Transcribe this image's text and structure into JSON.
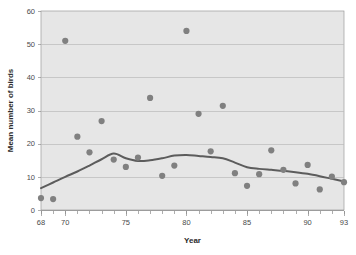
{
  "chart_data": {
    "type": "scatter",
    "title": "",
    "xlabel": "Year",
    "ylabel": "Mean number of birds",
    "xlim": [
      68,
      93
    ],
    "ylim": [
      0,
      60
    ],
    "grid": true,
    "legend": "none",
    "xticks": [
      68,
      70,
      75,
      80,
      85,
      90,
      93
    ],
    "xtick_labels": [
      "68",
      "70",
      "75",
      "80",
      "85",
      "90",
      "93"
    ],
    "xminor_step": 1,
    "yticks": [
      0,
      10,
      20,
      30,
      40,
      50,
      60
    ],
    "ytick_labels": [
      "0",
      "10",
      "20",
      "30",
      "40",
      "50",
      "60"
    ],
    "point_color": "#808080",
    "line_color": "#5c5c5c",
    "plot_bg_color": "#e6e6e6",
    "grid_color": "#b9b9b9",
    "x": [
      68,
      69,
      70,
      71,
      72,
      73,
      74,
      75,
      76,
      77,
      78,
      79,
      80,
      81,
      82,
      83,
      84,
      85,
      86,
      87,
      88,
      89,
      90,
      91,
      92,
      93
    ],
    "y": [
      3.6,
      3.3,
      51.0,
      22.1,
      17.4,
      26.8,
      15.2,
      13.0,
      15.8,
      33.8,
      10.3,
      13.4,
      54.0,
      29.0,
      17.7,
      31.4,
      11.1,
      7.3,
      10.8,
      18.0,
      12.1,
      8.0,
      13.6,
      6.2,
      10.1,
      8.4
    ],
    "series": [
      {
        "name": "Mean number of birds",
        "type": "scatter",
        "x": [
          68,
          69,
          70,
          71,
          72,
          73,
          74,
          75,
          76,
          77,
          78,
          79,
          80,
          81,
          82,
          83,
          84,
          85,
          86,
          87,
          88,
          89,
          90,
          91,
          92,
          93
        ],
        "values": [
          3.6,
          3.3,
          51.0,
          22.1,
          17.4,
          26.8,
          15.2,
          13.0,
          15.8,
          33.8,
          10.3,
          13.4,
          54.0,
          29.0,
          17.7,
          31.4,
          11.1,
          7.3,
          10.8,
          18.0,
          12.1,
          8.0,
          13.6,
          6.2,
          10.1,
          8.4
        ]
      },
      {
        "name": "Smoothed trend",
        "type": "line",
        "x": [
          68,
          69,
          70,
          71,
          72,
          73,
          74,
          75,
          76,
          77,
          78,
          79,
          80,
          81,
          82,
          83,
          84,
          85,
          86,
          87,
          88,
          89,
          90,
          91,
          92,
          93
        ],
        "values": [
          6.6,
          8.3,
          10.0,
          11.6,
          13.4,
          15.3,
          17.0,
          15.6,
          14.8,
          15.0,
          15.6,
          16.4,
          16.6,
          16.3,
          16.0,
          15.6,
          14.3,
          12.9,
          12.4,
          12.1,
          11.8,
          11.4,
          10.9,
          10.2,
          9.4,
          8.6
        ]
      }
    ]
  }
}
